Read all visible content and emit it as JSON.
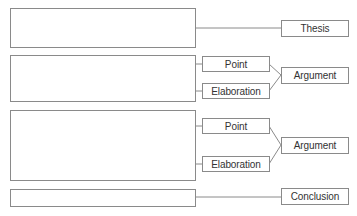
{
  "diagram": {
    "title": "",
    "sections": [
      {
        "id": "thesis",
        "label": "Thesis"
      },
      {
        "id": "argument-1",
        "label": "Argument",
        "parts": [
          "Point",
          "Elaboration"
        ]
      },
      {
        "id": "argument-2",
        "label": "Argument",
        "parts": [
          "Point",
          "Elaboration"
        ]
      },
      {
        "id": "conclusion",
        "label": "Conclusion"
      }
    ]
  },
  "labels": {
    "thesis": "Thesis",
    "arg1_point": "Point",
    "arg1_elaboration": "Elaboration",
    "arg1_argument": "Argument",
    "arg2_point": "Point",
    "arg2_elaboration": "Elaboration",
    "arg2_argument": "Argument",
    "conclusion": "Conclusion"
  },
  "colors": {
    "border": "#8a8a8a",
    "text": "#333333",
    "background": "#ffffff"
  }
}
